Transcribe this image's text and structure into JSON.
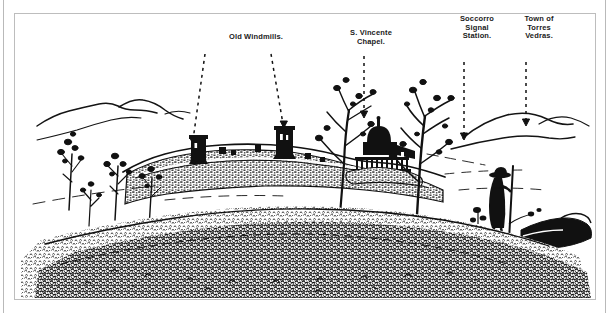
{
  "plate": {
    "kind": "engraved-panorama-illustration",
    "frame_border_color": "#bdbdbd",
    "ink_color": "#111111",
    "paper_color": "#ffffff"
  },
  "labels": [
    {
      "id": "old-windmills",
      "text": "Old Windmills.",
      "arrows": 2
    },
    {
      "id": "s-vincente-chapel",
      "text": "S. Vincente\nChapel.",
      "arrows": 1
    },
    {
      "id": "soccorro-signal-station",
      "text": "Soccorro\nSignal\nStation.",
      "arrows": 1
    },
    {
      "id": "town-of-torres-vedras",
      "text": "Town of\nTorres\nVedras.",
      "arrows": 1
    }
  ],
  "scene": {
    "foreground_figure": "sentry-soldier-with-staff",
    "features": [
      "two ruined windmill towers on fortified ridge",
      "domed chapel on earthwork redoubt",
      "bare trees in foreground",
      "distant rolling hills",
      "dense scrub and brush in lower foreground",
      "rocky outcrop at lower right"
    ]
  }
}
